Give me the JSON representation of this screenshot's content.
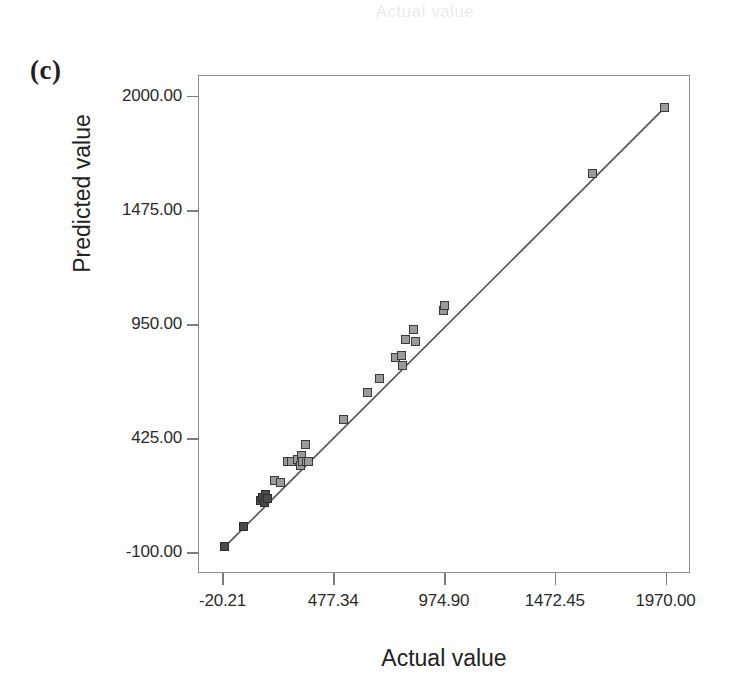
{
  "figure": {
    "panel_label": "(c)",
    "ghost_top_text": "Actual value"
  },
  "axes": {
    "x_title": "Actual value",
    "y_title": "Predicted value",
    "x_ticks": [
      "-20.21",
      "477.34",
      "974.90",
      "1472.45",
      "1970.00"
    ],
    "y_ticks": [
      "2000.00",
      "1475.00",
      "950.00",
      "425.00",
      "-100.00"
    ]
  },
  "chart_data": {
    "type": "scatter",
    "title": "(c)",
    "xlabel": "Actual value",
    "ylabel": "Predicted value",
    "xlim": [
      -130,
      2080
    ],
    "ylim": [
      -195,
      2095
    ],
    "xticks": [
      -20.21,
      477.34,
      974.9,
      1472.45,
      1970.0
    ],
    "yticks": [
      -100.0,
      425.0,
      950.0,
      1475.0,
      2000.0
    ],
    "grid": false,
    "legend": null,
    "marker": "square",
    "marker_color": "#9a9a9a",
    "marker_edge_color": "#3a3a3a",
    "line_color": "#555555",
    "series": [
      {
        "name": "Predicted vs Actual",
        "points": [
          [
            -11,
            -75
          ],
          [
            73,
            17
          ],
          [
            152,
            137
          ],
          [
            160,
            150
          ],
          [
            168,
            128
          ],
          [
            172,
            168
          ],
          [
            180,
            148
          ],
          [
            213,
            232
          ],
          [
            239,
            222
          ],
          [
            271,
            320
          ],
          [
            289,
            318
          ],
          [
            316,
            326
          ],
          [
            330,
            300
          ],
          [
            335,
            345
          ],
          [
            341,
            316
          ],
          [
            351,
            395
          ],
          [
            358,
            318
          ],
          [
            367,
            316
          ],
          [
            525,
            510
          ],
          [
            633,
            635
          ],
          [
            686,
            700
          ],
          [
            759,
            795
          ],
          [
            784,
            805
          ],
          [
            790,
            760
          ],
          [
            804,
            880
          ],
          [
            838,
            925
          ],
          [
            849,
            870
          ],
          [
            974,
            1010
          ],
          [
            978,
            1035
          ],
          [
            1644,
            1640
          ],
          [
            1967,
            1945
          ]
        ]
      }
    ],
    "fit_line": {
      "name": "identity reference line",
      "x": [
        -20.21,
        1970.0
      ],
      "y": [
        -85,
        1948
      ]
    }
  }
}
